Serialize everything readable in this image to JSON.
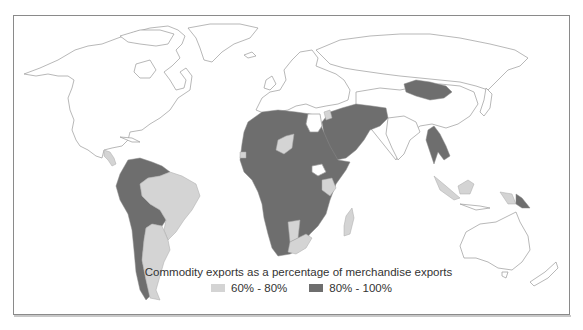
{
  "map": {
    "type": "choropleth world map",
    "colors": {
      "band_60_80": "#d4d4d4",
      "band_80_100": "#6e6e6e",
      "no_data": "#ffffff",
      "border": "#9a9a9a"
    }
  },
  "legend": {
    "title": "Commodity exports as a percentage of merchandise exports",
    "items": [
      {
        "label": "60% - 80%",
        "color": "#d4d4d4"
      },
      {
        "label": "80% - 100%",
        "color": "#6e6e6e"
      }
    ]
  },
  "regions": {
    "band_80_100": [
      "Venezuela",
      "Colombia",
      "Ecuador",
      "Peru",
      "Bolivia",
      "Chile",
      "Guyana",
      "Suriname",
      "Paraguay",
      "Mauritania",
      "Mali",
      "Algeria",
      "Libya",
      "Chad",
      "Sudan",
      "Nigeria",
      "Cameroon",
      "Gabon",
      "Congo",
      "DR Congo",
      "Angola",
      "Zambia",
      "Zimbabwe",
      "Mozambique",
      "Tanzania",
      "Ethiopia",
      "Somalia",
      "Botswana",
      "Saudi Arabia",
      "Yemen",
      "Oman",
      "Iraq",
      "Iran",
      "Afghanistan",
      "Kazakhstan",
      "Mongolia",
      "Myanmar",
      "Laos",
      "Papua New Guinea"
    ],
    "band_60_80": [
      "Brazil",
      "Argentina",
      "Uruguay",
      "Niger",
      "Senegal",
      "Ghana",
      "Kenya",
      "Uganda",
      "Namibia",
      "South Africa",
      "Madagascar",
      "Jordan",
      "Indonesia",
      "Central America"
    ]
  }
}
